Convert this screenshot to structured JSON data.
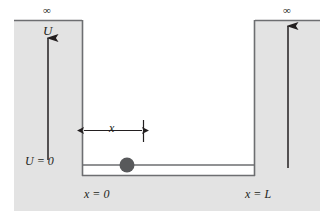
{
  "figure": {
    "background_color": "#ffffff",
    "barrier_color": "#e3e3e3",
    "line_color": "#6d6e71",
    "ink_color": "#231f20",
    "particle_color": "#58595b"
  },
  "labels": {
    "infinity_left": "∞",
    "infinity_right": "∞",
    "potential_axis": "U",
    "potential_zero": "U = 0",
    "x_origin": "x = 0",
    "x_length": "x = L",
    "position_x": "x"
  },
  "geometry": {
    "well_left_x": 82,
    "well_right_x": 255,
    "well_bottom_y": 176,
    "particle_line_y": 165,
    "barrier_top_y": 20,
    "barrier_left_start_x": 14,
    "barrier_right_end_x": 320,
    "particle_center_x": 127,
    "particle_radius": 7,
    "measure_line_y": 130,
    "measure_left_x": 83,
    "measure_right_x": 143
  },
  "elements": {
    "left_barrier": "left-potential-barrier",
    "right_barrier": "right-potential-barrier",
    "bottom_region": "bottom-gray-region",
    "left_arrow": "potential-axis-arrow",
    "right_arrow": "right-potential-arrow",
    "particle": "particle-marker",
    "measure_arrow": "position-measure-arrow",
    "well_floor": "well-floor-line",
    "particle_line": "particle-level-line"
  }
}
